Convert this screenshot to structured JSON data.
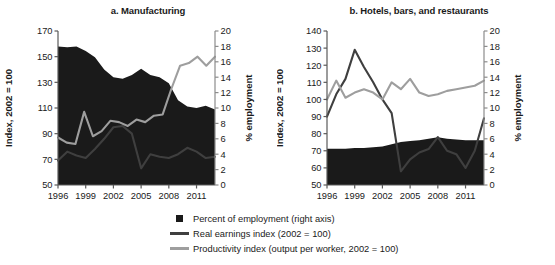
{
  "chart_data": [
    {
      "id": "a",
      "type": "area",
      "title": "a. Manufacturing",
      "xlabel": "",
      "ylabel": "Index, 2002 = 100",
      "y2label": "% employment",
      "ylim": [
        50,
        170
      ],
      "yticks": [
        50,
        70,
        90,
        110,
        130,
        150,
        170
      ],
      "y2lim": [
        0,
        20
      ],
      "y2ticks": [
        0,
        2,
        4,
        6,
        8,
        10,
        12,
        14,
        16,
        18,
        20
      ],
      "xlim": [
        1996,
        2013
      ],
      "xticks": [
        1996,
        1999,
        2002,
        2005,
        2008,
        2011
      ],
      "grid": false,
      "x": [
        1996,
        1997,
        1998,
        1999,
        2000,
        2001,
        2002,
        2003,
        2004,
        2005,
        2006,
        2007,
        2008,
        2009,
        2010,
        2011,
        2012,
        2013
      ],
      "series": [
        {
          "name": "Percent of employment (right axis)",
          "axis": "right",
          "kind": "area",
          "color": "#1a1a1a",
          "values": [
            18.0,
            17.9,
            18.0,
            17.4,
            16.6,
            15.0,
            14.0,
            13.8,
            14.3,
            15.1,
            14.3,
            14.0,
            13.2,
            11.0,
            10.2,
            10.0,
            10.3,
            9.8
          ]
        },
        {
          "name": "Real earnings index (2002 = 100)",
          "axis": "left",
          "kind": "line",
          "color": "#3f3f3f",
          "values": [
            69,
            76,
            73,
            71,
            78,
            86,
            95,
            96,
            90,
            63,
            74,
            72,
            71,
            74,
            79,
            76,
            71,
            72
          ]
        },
        {
          "name": "Productivity index (output per worker, 2002 = 100)",
          "axis": "left",
          "kind": "line",
          "color": "#9e9e9e",
          "values": [
            87,
            83,
            82,
            107,
            88,
            92,
            100,
            99,
            96,
            101,
            99,
            104,
            105,
            125,
            143,
            145,
            150,
            143,
            150
          ]
        }
      ]
    },
    {
      "id": "b",
      "type": "area",
      "title": "b. Hotels, bars, and restaurants",
      "xlabel": "",
      "ylabel": "Index, 2002 = 100",
      "y2label": "% employment",
      "ylim": [
        50,
        140
      ],
      "yticks": [
        50,
        60,
        70,
        80,
        90,
        100,
        110,
        120,
        130,
        140
      ],
      "y2lim": [
        0,
        20
      ],
      "y2ticks": [
        0,
        2,
        4,
        6,
        8,
        10,
        12,
        14,
        16,
        18,
        20
      ],
      "xlim": [
        1996,
        2013
      ],
      "xticks": [
        1996,
        1999,
        2002,
        2005,
        2008,
        2011
      ],
      "grid": false,
      "x": [
        1996,
        1997,
        1998,
        1999,
        2000,
        2001,
        2002,
        2003,
        2004,
        2005,
        2006,
        2007,
        2008,
        2009,
        2010,
        2011,
        2012,
        2013
      ],
      "series": [
        {
          "name": "Percent of employment (right axis)",
          "axis": "right",
          "kind": "area",
          "color": "#1a1a1a",
          "values": [
            4.7,
            4.7,
            4.7,
            4.8,
            4.8,
            4.9,
            5.0,
            5.3,
            5.6,
            5.7,
            5.8,
            6.0,
            6.2,
            6.0,
            5.9,
            5.8,
            5.8,
            5.8
          ]
        },
        {
          "name": "Real earnings index (2002 = 100)",
          "axis": "left",
          "kind": "line",
          "color": "#3f3f3f",
          "values": [
            90,
            103,
            112,
            129,
            119,
            110,
            100,
            92,
            58,
            65,
            69,
            71,
            78,
            70,
            68,
            60,
            70,
            89
          ]
        },
        {
          "name": "Productivity index (output per worker, 2002 = 100)",
          "axis": "left",
          "kind": "line",
          "color": "#9e9e9e",
          "values": [
            100,
            111,
            101,
            104,
            106,
            104,
            100,
            110,
            106,
            112,
            104,
            102,
            103,
            105,
            106,
            107,
            108,
            111
          ]
        }
      ]
    }
  ],
  "legend": {
    "items": [
      {
        "label": "Percent of employment (right axis)",
        "mark": "square",
        "color": "#1a1a1a"
      },
      {
        "label": "Real earnings index (2002 = 100)",
        "mark": "line",
        "color": "#3f3f3f"
      },
      {
        "label": "Productivity index (output per worker, 2002 = 100)",
        "mark": "line",
        "color": "#9e9e9e"
      }
    ]
  }
}
